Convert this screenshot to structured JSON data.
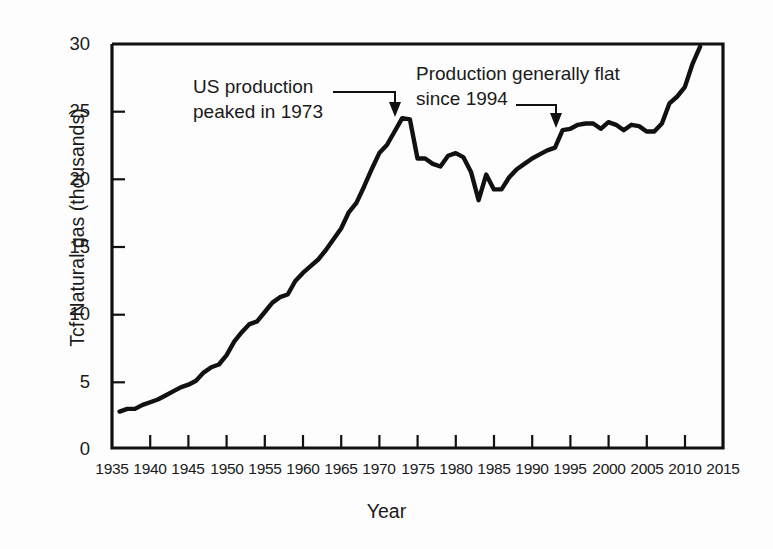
{
  "chart_data": {
    "type": "line",
    "title": "",
    "subtitle": "",
    "xlabel": "Year",
    "ylabel": "Tcf Natural gas (thousands)",
    "xlim": [
      1935,
      2015
    ],
    "ylim": [
      0,
      30
    ],
    "xticks": [
      1935,
      1940,
      1945,
      1950,
      1955,
      1960,
      1965,
      1970,
      1975,
      1980,
      1985,
      1990,
      1995,
      2000,
      2005,
      2010,
      2015
    ],
    "yticks": [
      0,
      5,
      10,
      15,
      20,
      25,
      30
    ],
    "grid": false,
    "legend": null,
    "line_color": "#111111",
    "series": [
      {
        "name": "US natural gas production",
        "x": [
          1936,
          1937,
          1938,
          1939,
          1940,
          1941,
          1942,
          1943,
          1944,
          1945,
          1946,
          1947,
          1948,
          1949,
          1950,
          1951,
          1952,
          1953,
          1954,
          1955,
          1956,
          1957,
          1958,
          1959,
          1960,
          1961,
          1962,
          1963,
          1964,
          1965,
          1966,
          1967,
          1968,
          1969,
          1970,
          1971,
          1972,
          1973,
          1974,
          1975,
          1976,
          1977,
          1978,
          1979,
          1980,
          1981,
          1982,
          1983,
          1984,
          1985,
          1986,
          1987,
          1988,
          1989,
          1990,
          1991,
          1992,
          1993,
          1994,
          1995,
          1996,
          1997,
          1998,
          1999,
          2000,
          2001,
          2002,
          2003,
          2004,
          2005,
          2006,
          2007,
          2008,
          2009,
          2010,
          2011,
          2012
        ],
        "y": [
          2.7,
          2.9,
          2.9,
          3.2,
          3.4,
          3.6,
          3.9,
          4.2,
          4.5,
          4.7,
          5.0,
          5.6,
          6.0,
          6.2,
          6.9,
          7.9,
          8.6,
          9.2,
          9.4,
          10.1,
          10.8,
          11.2,
          11.4,
          12.4,
          13.0,
          13.5,
          14.0,
          14.7,
          15.5,
          16.3,
          17.5,
          18.2,
          19.4,
          20.7,
          21.9,
          22.5,
          23.5,
          24.5,
          24.4,
          21.5,
          21.5,
          21.1,
          20.9,
          21.7,
          21.9,
          21.6,
          20.5,
          18.4,
          20.3,
          19.2,
          19.2,
          20.1,
          20.7,
          21.1,
          21.5,
          21.8,
          22.1,
          22.3,
          23.6,
          23.7,
          24.0,
          24.1,
          24.1,
          23.7,
          24.2,
          24.0,
          23.6,
          24.0,
          23.9,
          23.5,
          23.5,
          24.1,
          25.6,
          26.1,
          26.8,
          28.5,
          29.8
        ]
      }
    ],
    "annotations": [
      {
        "id": "peak",
        "text_line1": "US production",
        "text_line2": "peaked in 1973",
        "points_to_year": 1973,
        "points_to_value": 24.5
      },
      {
        "id": "flat",
        "text_line1": "Production generally flat",
        "text_line2": "since 1994",
        "points_to_year": 1994,
        "points_to_value": 23.6
      }
    ]
  },
  "axes": {
    "y_title": "Tcf Natural gas (thousands)",
    "x_title": "Year",
    "y_tick_labels": [
      "30",
      "25",
      "20",
      "15",
      "10",
      "5",
      "0"
    ],
    "x_tick_labels": [
      "1935",
      "1940",
      "1945",
      "1950",
      "1955",
      "1960",
      "1965",
      "1970",
      "1975",
      "1980",
      "1985",
      "1990",
      "1995",
      "2000",
      "2005",
      "2010",
      "2015"
    ]
  },
  "annotations": {
    "peak": {
      "line1": "US production",
      "line2": "peaked in 1973"
    },
    "flat": {
      "line1": "Production generally flat",
      "line2": "since 1994"
    }
  }
}
